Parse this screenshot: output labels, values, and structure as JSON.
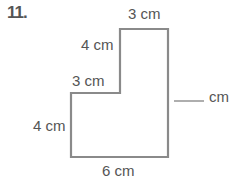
{
  "problem": {
    "number": "11.",
    "labels": {
      "top": "3 cm",
      "upper_left": "4 cm",
      "step": "3 cm",
      "lower_left": "4 cm",
      "bottom": "6 cm",
      "right_unknown": "cm"
    },
    "colors": {
      "outline": "#8a8a8a",
      "text": "#555555"
    }
  }
}
